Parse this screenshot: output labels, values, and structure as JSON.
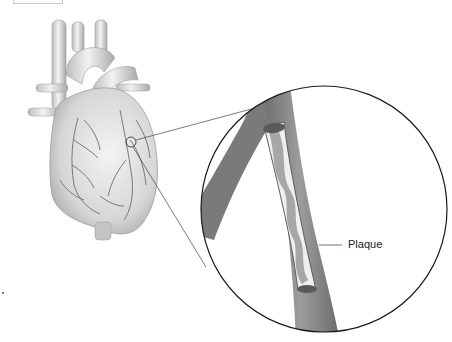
{
  "figure": {
    "labels": [
      {
        "text": "Plaque",
        "x": 345,
        "y": 240
      }
    ],
    "colors": {
      "heart_fill": "#dcdcdc",
      "heart_shadow": "#a8a8a8",
      "vessel_line": "#6e6e6e",
      "artery_wall": "#8a8a8a",
      "artery_dark": "#5e5e5e",
      "plaque": "#9a9a9a",
      "lumen": "#efefef",
      "circle_stroke": "#1a1a1a",
      "callout_line": "#444444"
    }
  }
}
